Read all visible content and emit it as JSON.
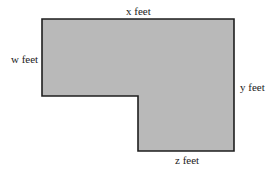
{
  "diagram": {
    "type": "L-shaped region",
    "fill_color": "#b9b9b9",
    "stroke_color": "#1e1e1e",
    "vertices": [
      [
        42,
        19
      ],
      [
        234,
        19
      ],
      [
        234,
        151
      ],
      [
        138,
        151
      ],
      [
        138,
        96
      ],
      [
        42,
        96
      ]
    ],
    "labels": {
      "top": "x feet",
      "left": "w feet",
      "right": "y feet",
      "bottom": "z feet"
    }
  }
}
